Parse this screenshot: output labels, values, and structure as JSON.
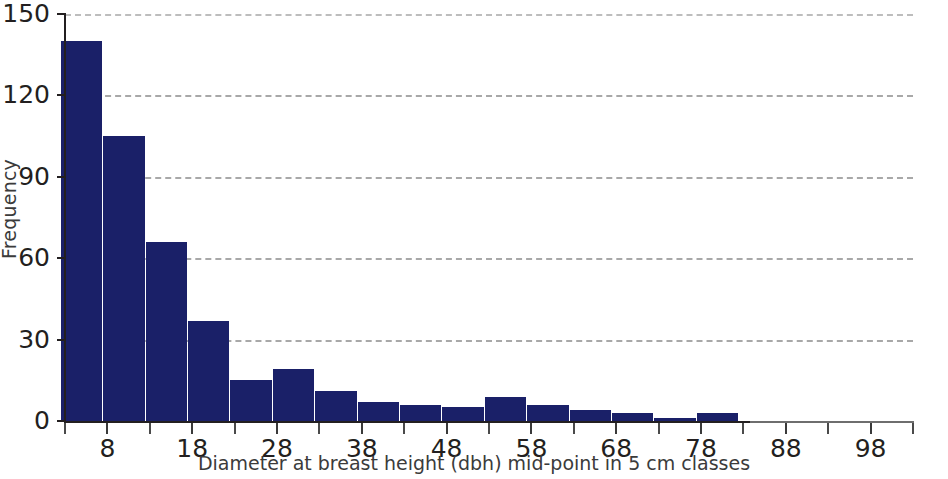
{
  "chart_data": {
    "type": "bar",
    "title": "",
    "subtitle": "",
    "xlabel": "Diameter at breast height (dbh) mid-point in 5 cm classes",
    "ylabel": "Frequency",
    "xlim": [
      3,
      103
    ],
    "ylim": [
      0,
      150
    ],
    "grid": "horizontal-dashed",
    "legend": "none",
    "bar_color": "#1a2068",
    "gridline_color": "#a8a8a8",
    "axis_color": "#231f20",
    "bin_width": 5,
    "categories": [
      5,
      10,
      15,
      20,
      25,
      30,
      35,
      40,
      45,
      50,
      55,
      60,
      65,
      70,
      75,
      80,
      85,
      90,
      95,
      100
    ],
    "values": [
      140,
      105,
      66,
      37,
      15,
      19,
      11,
      7,
      6,
      5,
      9,
      6,
      4,
      3,
      1,
      3,
      0,
      0,
      0,
      0
    ],
    "ytick_values": [
      0,
      30,
      60,
      90,
      120,
      150
    ],
    "ytick_labels": [
      "0",
      "30",
      "60",
      "90",
      "120",
      "150"
    ],
    "xtick_values": [
      3,
      8,
      13,
      18,
      23,
      28,
      33,
      38,
      43,
      48,
      53,
      58,
      63,
      68,
      73,
      78,
      83,
      88,
      93,
      98,
      103
    ],
    "xtick_labels": [
      "",
      "8",
      "",
      "18",
      "",
      "28",
      "",
      "38",
      "",
      "48",
      "",
      "58",
      "",
      "68",
      "",
      "78",
      "",
      "88",
      "",
      "98",
      ""
    ]
  }
}
